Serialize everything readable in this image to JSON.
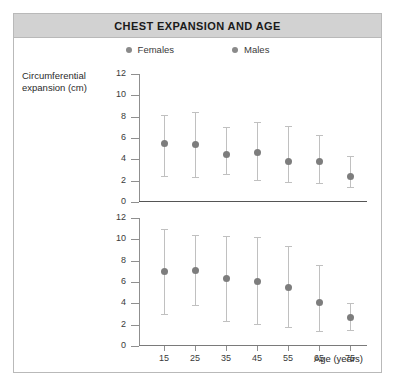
{
  "figure": {
    "title": "CHEST EXPANSION AND AGE"
  },
  "legend": {
    "position": "top-center",
    "entries": [
      {
        "label": "Females",
        "color": "#8a8a8a"
      },
      {
        "label": "Males",
        "color": "#8a8a8a"
      }
    ]
  },
  "axes": {
    "ylabel_line1": "Circumferential",
    "ylabel_line2": "expansion (cm)",
    "xlabel": "Age (years)"
  },
  "chart_data": {
    "type": "scatter",
    "title": "CHEST EXPANSION AND AGE",
    "xlabel": "Age (years)",
    "ylabel": "Circumferential expansion (cm)",
    "grid": false,
    "legend_position": "top-center",
    "marker_color": "#7d7d7d",
    "errorbar_color": "#c0c0c0",
    "x": [
      15,
      25,
      35,
      45,
      55,
      65,
      75
    ],
    "categories": [
      "15",
      "25",
      "35",
      "45",
      "55",
      "65",
      "75"
    ],
    "panels": [
      {
        "name": "Females",
        "ylim": [
          0,
          12
        ],
        "yticks": [
          0,
          2,
          4,
          6,
          8,
          10,
          12
        ],
        "values": [
          5.5,
          5.4,
          4.5,
          4.7,
          3.8,
          3.8,
          2.4
        ],
        "err_low": [
          2.4,
          2.3,
          2.6,
          2.1,
          1.9,
          1.8,
          1.4
        ],
        "err_high": [
          8.2,
          8.4,
          7.0,
          7.5,
          7.1,
          6.3,
          4.3
        ]
      },
      {
        "name": "Males",
        "ylim": [
          0,
          12
        ],
        "yticks": [
          0,
          2,
          4,
          6,
          8,
          10,
          12
        ],
        "values": [
          7.0,
          7.1,
          6.4,
          6.1,
          5.5,
          4.1,
          2.7
        ],
        "err_low": [
          3.0,
          3.8,
          2.3,
          2.1,
          1.8,
          1.4,
          1.5
        ],
        "err_high": [
          11.0,
          10.4,
          10.3,
          10.2,
          9.4,
          7.6,
          4.0
        ]
      }
    ]
  }
}
